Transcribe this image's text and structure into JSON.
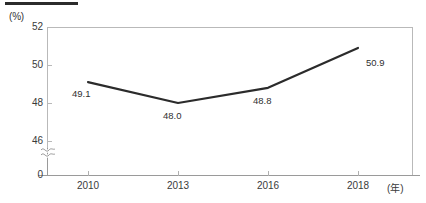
{
  "chart_data": {
    "type": "line",
    "title": "",
    "xlabel": "(年)",
    "ylabel": "(%)",
    "categories": [
      "2010",
      "2013",
      "2016",
      "2018"
    ],
    "x": [
      2010,
      2013,
      2016,
      2018
    ],
    "values": [
      49.1,
      48.0,
      48.8,
      50.9
    ],
    "point_labels": [
      "49.1",
      "48.0",
      "48.8",
      "50.9"
    ],
    "series": [
      {
        "name": "",
        "values": [
          49.1,
          48.0,
          48.8,
          50.9
        ]
      }
    ],
    "y_ticks": [
      "52",
      "50",
      "48",
      "46",
      "0"
    ],
    "ylim": [
      46,
      52
    ],
    "y_axis_break": true,
    "y_axis_break_symbol": "axis-break-squiggle",
    "grid": false,
    "legend": "none",
    "line_color": "#2b2b2b",
    "frame_color": "#b9b9b9",
    "axis_color": "#9a9a9a",
    "text_color": "#3a3a3a"
  },
  "axes": {
    "y_unit": "(%)",
    "x_unit": "(年)",
    "y_tick_labels": {
      "t52": "52",
      "t50": "50",
      "t48": "48",
      "t46": "46",
      "t0": "0"
    },
    "x_tick_labels": {
      "x2010": "2010",
      "x2013": "2013",
      "x2016": "2016",
      "x2018": "2018"
    }
  },
  "labels": {
    "p2010": "49.1",
    "p2013": "48.0",
    "p2016": "48.8",
    "p2018": "50.9"
  }
}
